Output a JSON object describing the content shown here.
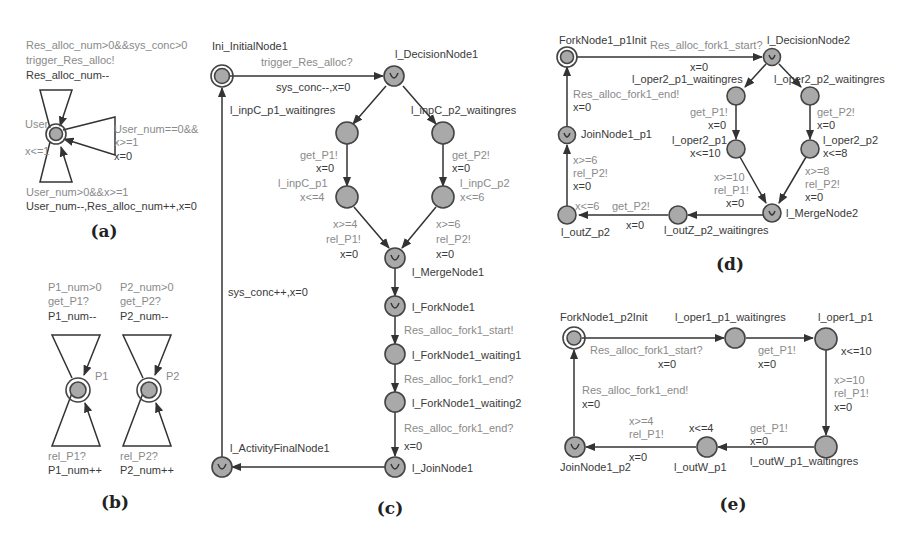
{
  "colors": {
    "node_fill": "#a9a9a9",
    "node_stroke": "#444444",
    "edge": "#333333",
    "label_dark": "#3a3a3a",
    "label_gray": "#8a8a8a"
  },
  "panels": {
    "a": {
      "caption": "(a)",
      "location": "User",
      "invariant": "x<=1",
      "top_loop": {
        "guard": "Res_alloc_num>0&&sys_conc>0",
        "sync": "trigger_Res_alloc!",
        "update": "Res_alloc_num--"
      },
      "right_loop": {
        "guard1": "User_num==0&&",
        "guard2": "x>=1",
        "update": "x=0"
      },
      "bottom_loop": {
        "guard": "User_num>0&&x>=1",
        "update": "User_num--,Res_alloc_num++,x=0"
      }
    },
    "b": {
      "caption": "(b)",
      "p1": {
        "location": "P1",
        "guard": "P1_num>0",
        "sync_get": "get_P1?",
        "update_get": "P1_num--",
        "sync_rel": "rel_P1?",
        "update_rel": "P1_num++"
      },
      "p2": {
        "location": "P2",
        "guard": "P2_num>0",
        "sync_get": "get_P2?",
        "update_get": "P2_num--",
        "sync_rel": "rel_P2?",
        "update_rel": "P2_num++"
      }
    },
    "c": {
      "caption": "(c)",
      "nodes": {
        "initial": "Ini_InitialNode1",
        "decision": "l_DecisionNode1",
        "p1_wait": "l_inpC_p1_waitingres",
        "p2_wait": "l_inpC_p2_waitingres",
        "p1": "l_inpC_p1",
        "p2": "l_inpC_p2",
        "p1_inv": "x<=4",
        "p2_inv": "x<=6",
        "merge": "l_MergeNode1",
        "fork": "l_ForkNode1",
        "fork_w1": "l_ForkNode1_waiting1",
        "fork_w2": "l_ForkNode1_waiting2",
        "join": "l_JoinNode1",
        "final": "l_ActivityFinalNode1"
      },
      "edges": {
        "init_sync": "trigger_Res_alloc?",
        "init_update": "sys_conc--,x=0",
        "get_p1": "get_P1!",
        "get_p1_update": "x=0",
        "get_p2": "get_P2!",
        "get_p2_update": "x=0",
        "rel_p1_guard": "x>=4",
        "rel_p1_sync": "rel_P1!",
        "rel_p1_update": "x=0",
        "rel_p2_guard": "x>=6",
        "rel_p2_sync": "rel_P2!",
        "rel_p2_update": "x=0",
        "fork_start": "Res_alloc_fork1_start!",
        "fork_end1": "Res_alloc_fork1_end?",
        "fork_end2": "Res_alloc_fork1_end?",
        "join_update": "x=0",
        "back_update": "sys_conc++,x=0"
      }
    },
    "d": {
      "caption": "(d)",
      "nodes": {
        "init": "ForkNode1_p1Init",
        "decision": "l_DecisionNode2",
        "p1_wait": "l_oper2_p1_waitingres",
        "p2_wait": "l_oper2_p2_waitingres",
        "p1": "l_oper2_p1",
        "p1_inv": "x<=10",
        "p2": "l_oper2_p2",
        "p2_inv": "x<=8",
        "merge": "l_MergeNode2",
        "out_wait": "l_outZ_p2_waitingres",
        "out": "l_outZ_p2",
        "out_inv": "x<=6",
        "join": "JoinNode1_p1"
      },
      "edges": {
        "start_sync": "Res_alloc_fork1_start?",
        "start_update": "x=0",
        "get_p1": "get_P1!",
        "get_p1_update": "x=0",
        "get_p2": "get_P2!",
        "get_p2_update": "x=0",
        "rel_p1_guard": "x>=10",
        "rel_p1_sync": "rel_P1!",
        "rel_p1_update": "x=0",
        "rel_p2_guard": "x>=8",
        "rel_p2_sync": "rel_P2!",
        "rel_p2_update": "x=0",
        "out_get": "get_P2!",
        "out_get_update": "x=0",
        "out_rel_guard": "x>=6",
        "out_rel_sync": "rel_P2!",
        "out_rel_update": "x=0",
        "end_sync": "Res_alloc_fork1_end!",
        "end_update": "x=0"
      }
    },
    "e": {
      "caption": "(e)",
      "nodes": {
        "init": "ForkNode1_p2Init",
        "p1_wait": "l_oper1_p1_waitingres",
        "p1": "l_oper1_p1",
        "p1_inv": "x<=10",
        "out_wait": "l_outW_p1_waitingres",
        "out": "l_outW_p1",
        "out_inv": "x<=4",
        "join": "JoinNode1_p2"
      },
      "edges": {
        "start_sync": "Res_alloc_fork1_start?",
        "start_update": "x=0",
        "get_p1": "get_P1!",
        "get_p1_update": "x=0",
        "rel_guard": "x>=10",
        "rel_sync": "rel_P1!",
        "rel_update": "x=0",
        "out_get": "get_P1!",
        "out_get_update": "x=0",
        "out_rel_guard": "x>=4",
        "out_rel_sync": "rel_P1!",
        "out_rel_update": "x=0",
        "end_sync": "Res_alloc_fork1_end!",
        "end_update": "x=0"
      }
    }
  }
}
